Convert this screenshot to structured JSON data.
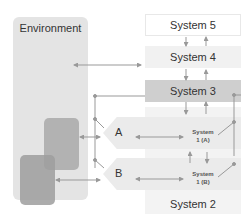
{
  "environment": {
    "label": "Environment"
  },
  "systems": {
    "system5": "System 5",
    "system4": "System 4",
    "system3": "System 3",
    "system2": "System 2",
    "system1a": [
      "System",
      "1 (A)"
    ],
    "system1b": [
      "System",
      "1 (B)"
    ]
  },
  "operations": {
    "a": "A",
    "b": "B"
  },
  "colors": {
    "environment": "#e4e4e4",
    "system3": "#cfcfcf",
    "system4": "#f1f1f1",
    "system2": "#f3f3f3",
    "operation": "#ebebeb",
    "inner_box": "#a9a9a9",
    "line": "#999999"
  }
}
